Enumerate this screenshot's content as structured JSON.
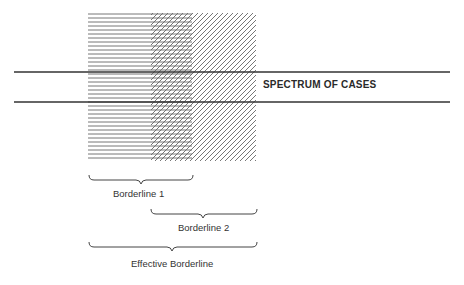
{
  "diagram": {
    "spectrum_label": "SPECTRUM OF CASES",
    "borderline1_label": "Borderline 1",
    "borderline2_label": "Borderline 2",
    "effective_label": "Effective Borderline",
    "regions": [
      {
        "name": "borderline-1",
        "pattern": "horizontal-lines",
        "x_start": 88,
        "x_end": 192
      },
      {
        "name": "borderline-2",
        "pattern": "diagonal-lines",
        "x_start": 151,
        "x_end": 256
      }
    ],
    "colors": {
      "line": "#333333",
      "hatch": "#555555",
      "background": "#ffffff"
    }
  }
}
